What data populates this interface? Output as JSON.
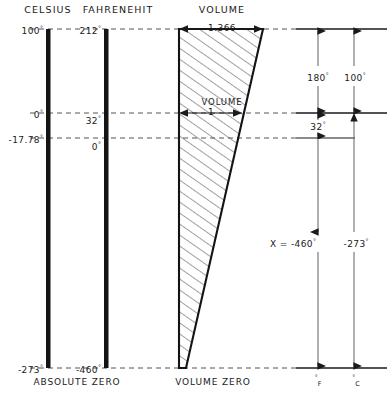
{
  "diagram": {
    "title_celsius": "CELSIUS",
    "title_fahrenheit": "FAHRENEHIT",
    "title_volume": "VOLUME",
    "celsius": {
      "boiling": "100",
      "freezing": "0",
      "zero_f_equiv": "-17.78",
      "absolute_zero": "-273"
    },
    "fahrenheit": {
      "boiling": "212",
      "freezing": "32",
      "zero": "0",
      "absolute_zero": "-460"
    },
    "volume": {
      "top_value": "1.366",
      "inner_label": "VOLUME",
      "inner_value": "1"
    },
    "dimensions": {
      "span_f": "180",
      "span_c": "100",
      "offset_f": "32",
      "x_equals": "X = -460",
      "x_celsius": "-273"
    },
    "footers": {
      "absolute_zero": "ABSOLUTE ZERO",
      "volume_zero": "VOLUME ZERO",
      "axis_f": "F",
      "axis_c": "C"
    },
    "degree_symbol": "°",
    "colors": {
      "ink": "#1a1a1a",
      "hatch": "#2b2b2b",
      "dashed": "#555555"
    }
  }
}
